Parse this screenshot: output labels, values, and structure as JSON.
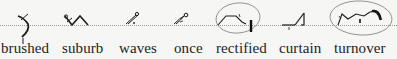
{
  "document": {
    "type": "shorthand outline chart",
    "baseline_style": "dotted",
    "ink_color": "#1d1d1d",
    "annotation_color": "#777777",
    "entries": [
      {
        "word": "brushed",
        "circled": false
      },
      {
        "word": "suburb",
        "circled": false
      },
      {
        "word": "waves",
        "circled": false
      },
      {
        "word": "once",
        "circled": false
      },
      {
        "word": "rectified",
        "circled": true
      },
      {
        "word": "curtain",
        "circled": false
      },
      {
        "word": "turnover",
        "circled": true
      }
    ]
  }
}
